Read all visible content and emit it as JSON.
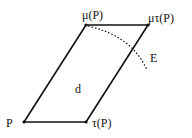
{
  "diagram": {
    "type": "parallelogram",
    "labels": {
      "p": "P",
      "tau_p": "τ(P)",
      "mu_p": "μ(P)",
      "mu_tau_p": "μτ(P)",
      "interior": "d",
      "curve": "E"
    },
    "colors": {
      "stroke": "#111111",
      "background": "#ffffff"
    }
  }
}
